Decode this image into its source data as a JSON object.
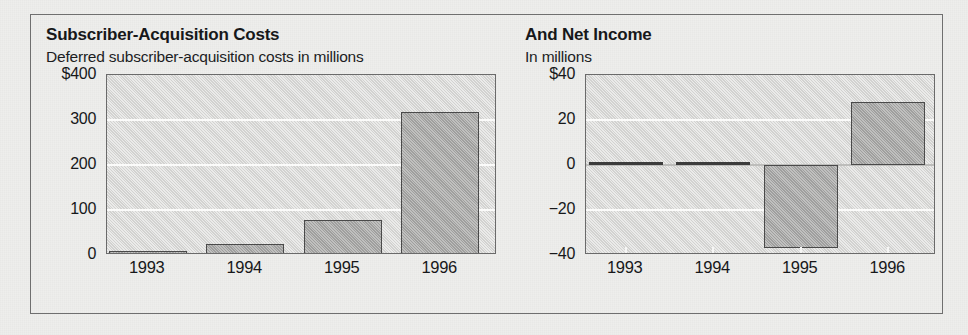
{
  "figure": {
    "background_color": "#eeeeec",
    "frame_border_color": "#6f6f6f",
    "plot_background_color": "#d6d6d4",
    "bar_fill_color": "#a8a8a6",
    "bar_border_color": "#4a4a4a",
    "gridline_color": "#fbfbfa"
  },
  "panels": [
    {
      "key": "left",
      "title": "Subscriber-Acquisition Costs",
      "subtitle": "Deferred subscriber-acquisition costs in millions"
    },
    {
      "key": "right",
      "title": "And Net Income",
      "subtitle": "In millions"
    }
  ],
  "chart_data": [
    {
      "type": "bar",
      "title": "Subscriber-Acquisition Costs",
      "subtitle": "Deferred subscriber-acquisition costs in millions",
      "xlabel": "",
      "ylabel": "",
      "categories": [
        "1993",
        "1994",
        "1995",
        "1996"
      ],
      "values": [
        10,
        25,
        77,
        317
      ],
      "ylim": [
        0,
        400
      ],
      "yticks": [
        0,
        100,
        200,
        300,
        400
      ],
      "ytick_labels": [
        "0",
        "100",
        "200",
        "300",
        "$400"
      ],
      "grid": true,
      "gridlines_at": [
        100,
        200,
        300
      ],
      "legend": "none",
      "units": "millions of dollars"
    },
    {
      "type": "bar",
      "title": "And Net Income",
      "subtitle": "In millions",
      "xlabel": "",
      "ylabel": "",
      "categories": [
        "1993",
        "1994",
        "1995",
        "1996"
      ],
      "values": [
        0,
        1.5,
        -37,
        28
      ],
      "ylim": [
        -40,
        40
      ],
      "yticks": [
        -40,
        -20,
        0,
        20,
        40
      ],
      "ytick_labels": [
        "−40",
        "−20",
        "0",
        "20",
        "$40"
      ],
      "grid": true,
      "gridlines_at": [
        -20,
        20
      ],
      "zero_line": 0,
      "legend": "none",
      "units": "millions of dollars"
    }
  ]
}
